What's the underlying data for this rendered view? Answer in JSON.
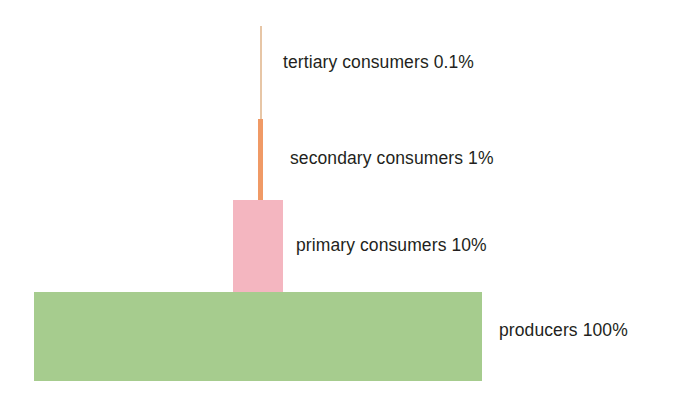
{
  "diagram": {
    "type": "ecological-energy-pyramid",
    "background_color": "#ffffff",
    "levels": [
      {
        "key": "tertiary",
        "label": "tertiary consumers 0.1%",
        "name": "tertiary consumers",
        "percent": "0.1%",
        "value": 0.1,
        "color": "#e7c6a6"
      },
      {
        "key": "secondary",
        "label": "secondary consumers 1%",
        "name": "secondary consumers",
        "percent": "1%",
        "value": 1,
        "color": "#f09a66"
      },
      {
        "key": "primary",
        "label": "primary consumers 10%",
        "name": "primary consumers",
        "percent": "10%",
        "value": 10,
        "color": "#f4b6c0"
      },
      {
        "key": "producers",
        "label": "producers 100%",
        "name": "producers",
        "percent": "100%",
        "value": 100,
        "color": "#a6cc8e"
      }
    ]
  }
}
